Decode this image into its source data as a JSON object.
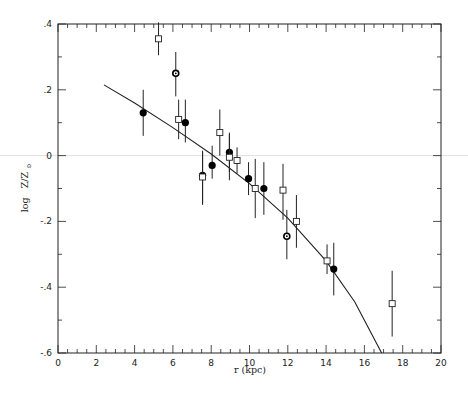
{
  "chart_data": {
    "type": "scatter",
    "title": "",
    "xlabel": "r (kpc)",
    "ylabel": "log Z/Z⊙",
    "xlim": [
      0,
      20
    ],
    "ylim": [
      -0.6,
      0.4
    ],
    "xticks": [
      0,
      2,
      4,
      6,
      8,
      10,
      12,
      14,
      16,
      18,
      20
    ],
    "xtick_labels": [
      "0",
      "2",
      "4",
      "6",
      "8",
      "10",
      "12",
      "14",
      "16",
      "18",
      "20"
    ],
    "yticks": [
      0.4,
      0.2,
      0,
      -0.2,
      -0.4,
      -0.6
    ],
    "ytick_labels": [
      ".4",
      ".2",
      "0",
      "-.2",
      "-.4",
      "-.6"
    ],
    "x_minor_step": 0.5,
    "y_minor_step": 0.1,
    "grid": false,
    "reference_line": {
      "y": 0,
      "color": "#d8d8d8"
    },
    "series": [
      {
        "name": "filled circles",
        "marker": "filled-circle",
        "points": [
          {
            "x": 4.45,
            "y": 0.13,
            "err_lo": 0.07,
            "err_hi": 0.07
          },
          {
            "x": 6.65,
            "y": 0.1,
            "err_lo": 0.06,
            "err_hi": 0.07
          },
          {
            "x": 7.55,
            "y": -0.06,
            "err_lo": 0.09,
            "err_hi": 0.07
          },
          {
            "x": 8.05,
            "y": -0.03,
            "err_lo": 0.04,
            "err_hi": 0.06
          },
          {
            "x": 8.95,
            "y": 0.01,
            "err_lo": 0.06,
            "err_hi": 0.06
          },
          {
            "x": 9.95,
            "y": -0.07,
            "err_lo": 0.05,
            "err_hi": 0.05
          },
          {
            "x": 10.75,
            "y": -0.1,
            "err_lo": 0.08,
            "err_hi": 0.08
          },
          {
            "x": 14.4,
            "y": -0.345,
            "err_lo": 0.08,
            "err_hi": 0.08
          }
        ]
      },
      {
        "name": "open squares",
        "marker": "open-square",
        "points": [
          {
            "x": 5.25,
            "y": 0.355,
            "err_lo": 0.05,
            "err_hi": 0.05
          },
          {
            "x": 6.3,
            "y": 0.11,
            "err_lo": 0.06,
            "err_hi": 0.06
          },
          {
            "x": 7.55,
            "y": -0.065,
            "err_lo": 0.08,
            "err_hi": 0.08
          },
          {
            "x": 8.45,
            "y": 0.07,
            "err_lo": 0.07,
            "err_hi": 0.07
          },
          {
            "x": 8.95,
            "y": -0.005,
            "err_lo": 0.07,
            "err_hi": 0.07
          },
          {
            "x": 9.35,
            "y": -0.015,
            "err_lo": 0.04,
            "err_hi": 0.04
          },
          {
            "x": 10.3,
            "y": -0.1,
            "err_lo": 0.09,
            "err_hi": 0.09
          },
          {
            "x": 11.75,
            "y": -0.105,
            "err_lo": 0.09,
            "err_hi": 0.08
          },
          {
            "x": 12.45,
            "y": -0.2,
            "err_lo": 0.08,
            "err_hi": 0.08
          },
          {
            "x": 14.05,
            "y": -0.32,
            "err_lo": 0.04,
            "err_hi": 0.05
          },
          {
            "x": 17.45,
            "y": -0.45,
            "err_lo": 0.1,
            "err_hi": 0.1
          }
        ]
      },
      {
        "name": "circles with dot",
        "marker": "dotted-circle",
        "points": [
          {
            "x": 6.15,
            "y": 0.25,
            "err_lo": 0.07,
            "err_hi": 0.065
          },
          {
            "x": 11.95,
            "y": -0.245,
            "err_lo": 0.07,
            "err_hi": 0.08
          }
        ]
      },
      {
        "name": "model curve",
        "marker": "line",
        "points": [
          {
            "x": 2.4,
            "y": 0.215
          },
          {
            "x": 4.0,
            "y": 0.16
          },
          {
            "x": 6.0,
            "y": 0.085
          },
          {
            "x": 8.0,
            "y": 0.005
          },
          {
            "x": 10.0,
            "y": -0.085
          },
          {
            "x": 12.0,
            "y": -0.19
          },
          {
            "x": 14.0,
            "y": -0.32
          },
          {
            "x": 15.5,
            "y": -0.445
          },
          {
            "x": 16.9,
            "y": -0.6
          }
        ]
      }
    ]
  },
  "axes": {
    "xlabel": "r (kpc)",
    "ylabel_prefix": "log",
    "ylabel_var": "Z/Z",
    "ylabel_sub": "⊙"
  }
}
